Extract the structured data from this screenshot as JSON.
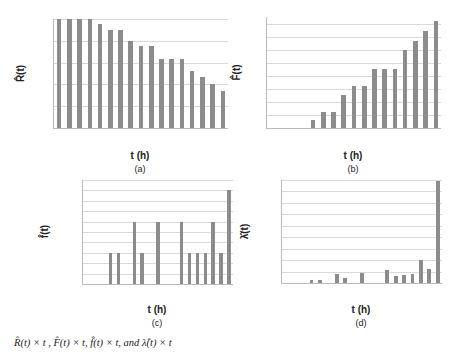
{
  "chart_data": [
    {
      "id": "a",
      "type": "bar",
      "title": "",
      "xlabel": "t (h)",
      "ylabel": "R̂(t)",
      "sublabel": "(a)",
      "ylim": [
        0.75,
        1.0
      ],
      "yticks": [
        "0.75",
        "0.80",
        "0.85",
        "0.90",
        "0.95",
        "1.00"
      ],
      "grid": true,
      "categories": [
        "0",
        "168",
        "336",
        "504",
        "672",
        "840",
        "1008",
        "1176",
        "1344",
        "1512",
        "1680",
        "1848",
        "2016",
        "2184",
        "2352",
        "2520",
        "2688"
      ],
      "values": [
        1.0,
        1.0,
        1.0,
        1.0,
        0.988,
        0.975,
        0.975,
        0.95,
        0.938,
        0.938,
        0.909,
        0.909,
        0.909,
        0.88,
        0.866,
        0.851,
        0.836
      ]
    },
    {
      "id": "b",
      "type": "bar",
      "title": "",
      "xlabel": "t (h)",
      "ylabel": "F̂(t)",
      "sublabel": "(b)",
      "ylim": [
        0,
        0.17
      ],
      "yticks": [
        "0.00",
        "0.02",
        "0.04",
        "0.06",
        "0.08",
        "0.10",
        "0.12",
        "0.14",
        "0.16"
      ],
      "grid": true,
      "categories": [
        "0",
        "168",
        "336",
        "504",
        "672",
        "840",
        "1008",
        "1176",
        "1344",
        "1512",
        "1680",
        "1848",
        "2016",
        "2184",
        "2352",
        "2520",
        "2688"
      ],
      "values": [
        0,
        0,
        0,
        0,
        0.012,
        0.025,
        0.025,
        0.051,
        0.064,
        0.064,
        0.091,
        0.091,
        0.091,
        0.12,
        0.134,
        0.149,
        0.164
      ]
    },
    {
      "id": "c",
      "type": "bar",
      "title": "",
      "xlabel": "t (h)",
      "ylabel": "f̂(t)",
      "sublabel": "(c)",
      "ylim": [
        0,
        0.001
      ],
      "yticks": [
        "0.00000",
        "0.00010",
        "0.00020",
        "0.00030",
        "0.00040",
        "0.00050",
        "0.00060",
        "0.00070",
        "0.00080",
        "0.00090",
        "0.00100"
      ],
      "grid": true,
      "categories": [
        "0",
        "168",
        "336",
        "504",
        "672",
        "840",
        "1008",
        "1176",
        "1344",
        "1512",
        "1680",
        "1848",
        "2016",
        "2184",
        "2352",
        "2520",
        "2688",
        "2856",
        "3024"
      ],
      "values": [
        0,
        0,
        0,
        0.0003,
        0.0003,
        0,
        0.0006,
        0.0003,
        0,
        0.0006,
        0,
        0,
        0.0006,
        0.0003,
        0.0003,
        0.0003,
        0.0006,
        0.0003,
        0.0009
      ]
    },
    {
      "id": "d",
      "type": "bar",
      "title": "",
      "xlabel": "t (h)",
      "ylabel": "λ̂(t)",
      "sublabel": "(d)",
      "ylim": [
        0,
        0.009
      ],
      "yticks": [
        "0.000",
        "0.001",
        "0.002",
        "0.003",
        "0.004",
        "0.005",
        "0.006",
        "0.007",
        "0.008",
        "0.009"
      ],
      "grid": true,
      "categories": [
        "0",
        "168",
        "336",
        "504",
        "672",
        "840",
        "1008",
        "1176",
        "1344",
        "1512",
        "1680",
        "1848",
        "2016",
        "2184",
        "2352",
        "2520",
        "2688",
        "2856",
        "3024"
      ],
      "values": [
        0,
        0,
        0,
        0.0003,
        0.0003,
        0,
        0.00075,
        0.0004,
        0,
        0.0009,
        0,
        0,
        0.0011,
        0.0006,
        0.0007,
        0.00075,
        0.002,
        0.0012,
        0.0089
      ]
    }
  ],
  "layout": {
    "a": {
      "left": 53,
      "top": 19,
      "width": 174,
      "height": 109,
      "bar_color": "#8c8c8c"
    },
    "b": {
      "left": 266,
      "top": 17,
      "width": 174,
      "height": 111,
      "bar_color": "#8c8c8c"
    },
    "c": {
      "left": 82,
      "top": 180,
      "width": 150,
      "height": 104,
      "bar_color": "#8c8c8c"
    },
    "d": {
      "left": 281,
      "top": 180,
      "width": 160,
      "height": 103,
      "bar_color": "#8c8c8c"
    }
  },
  "caption": "R̂(t) × t , F̂(t) × t, f̂(t) × t, and λ̂(t) × t"
}
